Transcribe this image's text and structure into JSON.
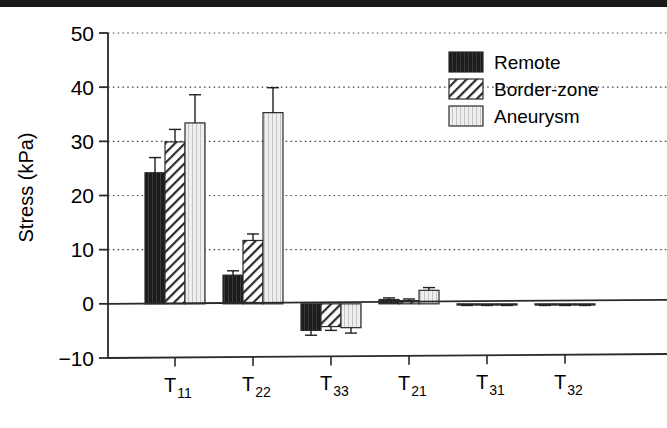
{
  "figure": {
    "name": "grouped-bar-chart-stress-components",
    "background": "#ffffff",
    "scan_artifact_color": "#1a1a1a"
  },
  "axes": {
    "y_title": "Stress (kPa)",
    "y_ticks": [
      "50",
      "40",
      "30",
      "20",
      "10",
      "0",
      "−10"
    ],
    "y_tick_values": [
      50,
      40,
      30,
      20,
      10,
      0,
      -10
    ],
    "x_tick_bases": [
      "T",
      "T",
      "T",
      "T",
      "T",
      "T"
    ],
    "x_tick_subs": [
      "11",
      "22",
      "33",
      "21",
      "31",
      "32"
    ]
  },
  "legend": {
    "items": [
      {
        "label": "Remote",
        "pattern": "solid-dark",
        "color": "#1c1c1c"
      },
      {
        "label": "Border-zone",
        "pattern": "diagonal-hatch",
        "color": "#ffffff"
      },
      {
        "label": "Aneurysm",
        "pattern": "vertical-lines",
        "color": "#ededed"
      }
    ]
  },
  "chart_data": {
    "type": "bar",
    "title": "",
    "xlabel": "",
    "ylabel": "Stress (kPa)",
    "ylim": [
      -10,
      50
    ],
    "grid": true,
    "grid_axis": "y",
    "legend_position": "top-right",
    "categories": [
      "T11",
      "T22",
      "T33",
      "T21",
      "T31",
      "T32"
    ],
    "series": [
      {
        "name": "Remote",
        "values": [
          24.2,
          5.3,
          -4.9,
          0.8,
          -0.2,
          -0.2
        ],
        "errors": [
          2.8,
          0.8,
          0.9,
          0.3,
          0.1,
          0.1
        ]
      },
      {
        "name": "Border-zone",
        "values": [
          29.9,
          11.7,
          -4.2,
          0.6,
          -0.2,
          -0.2
        ],
        "errors": [
          2.3,
          1.2,
          0.7,
          0.3,
          0.1,
          0.1
        ]
      },
      {
        "name": "Aneurysm",
        "values": [
          33.4,
          35.3,
          -4.4,
          2.5,
          -0.2,
          -0.2
        ],
        "errors": [
          5.2,
          4.6,
          1.0,
          0.5,
          0.1,
          0.1
        ]
      }
    ]
  }
}
